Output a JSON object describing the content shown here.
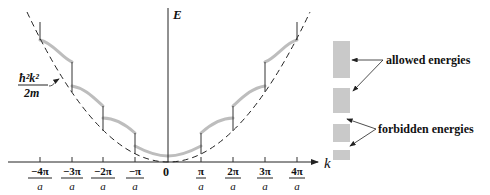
{
  "diagram": {
    "type": "band-structure-dispersion",
    "axes": {
      "y_label": "E",
      "x_label": "k",
      "origin_label": "0"
    },
    "x_ticks": [
      {
        "num": "−4π",
        "den": "a",
        "x": 40
      },
      {
        "num": "−3π",
        "den": "a",
        "x": 72
      },
      {
        "num": "−2π",
        "den": "a",
        "x": 103
      },
      {
        "num": "−π",
        "den": "a",
        "x": 135
      },
      {
        "num": "π",
        "den": "a",
        "x": 201
      },
      {
        "num": "2π",
        "den": "a",
        "x": 233
      },
      {
        "num": "3π",
        "den": "a",
        "x": 265
      },
      {
        "num": "4π",
        "den": "a",
        "x": 297
      }
    ],
    "free_electron_label": {
      "numerator": "ħ²k²",
      "denominator": "2m"
    },
    "annotations": {
      "allowed": "allowed energies",
      "forbidden": "forbidden energies"
    },
    "colors": {
      "axis": "#222222",
      "dashed_parabola": "#222222",
      "band_curve": "#bdbdbd",
      "band_block": "#c9c9c9"
    },
    "energy_bands": [
      {
        "kind": "allowed",
        "y_top": 41,
        "y_bottom": 78
      },
      {
        "kind": "allowed",
        "y_top": 88,
        "y_bottom": 113
      },
      {
        "kind": "allowed",
        "y_top": 124,
        "y_bottom": 142
      },
      {
        "kind": "allowed",
        "y_top": 150,
        "y_bottom": 160
      }
    ]
  }
}
